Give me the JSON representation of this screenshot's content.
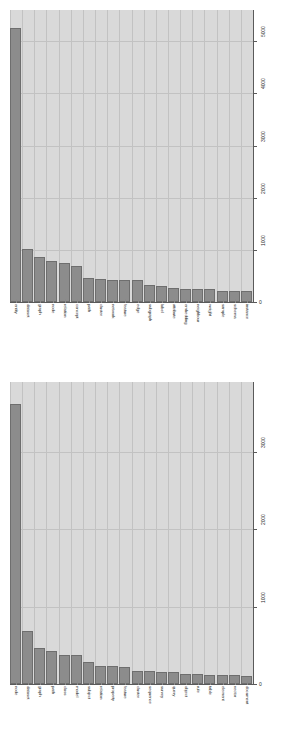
{
  "figure": {
    "background_color": "#ffffff",
    "plot_background_color": "#d9d9d9",
    "gridline_color": "#c2c2c2",
    "bar_color": "#8c8c8c",
    "bar_edge_color": "#6e6e6e",
    "axis_color": "#5a5a5a"
  },
  "chart_data": [
    {
      "type": "bar",
      "title": "",
      "xlabel": "",
      "ylabel": "",
      "grid": true,
      "legend": null,
      "ylim": [
        0,
        5600
      ],
      "yticks": [
        0,
        1000,
        2000,
        3000,
        4000,
        5000
      ],
      "ytick_labels": [
        "0",
        "1000",
        "2000",
        "3000",
        "4000",
        "5000"
      ],
      "ytick_position": "right",
      "xtick_rotation": 90,
      "categories": [
        "entity",
        "dataset",
        "graph",
        "node",
        "relation",
        "concept",
        "path",
        "cluster",
        "network",
        "feature",
        "edge",
        "subgraph",
        "label",
        "attribute",
        "embedding",
        "neighbour",
        "weight",
        "sample",
        "schema",
        "instance"
      ],
      "values": [
        5250,
        1010,
        870,
        790,
        740,
        700,
        470,
        440,
        430,
        430,
        430,
        330,
        310,
        260,
        250,
        250,
        250,
        220,
        220,
        210
      ]
    },
    {
      "type": "bar",
      "title": "",
      "xlabel": "",
      "ylabel": "",
      "grid": true,
      "legend": null,
      "ylim": [
        0,
        3900
      ],
      "yticks": [
        0,
        1000,
        2000,
        3000
      ],
      "ytick_labels": [
        "0",
        "1000",
        "2000",
        "3000"
      ],
      "ytick_position": "right",
      "xtick_rotation": 90,
      "categories": [
        "node",
        "dataset",
        "graph",
        "path",
        "class",
        "model",
        "subject",
        "relation",
        "property",
        "feature",
        "cluster",
        "sequence",
        "survey",
        "query",
        "object",
        "rule",
        "table",
        "element",
        "vector",
        "document"
      ],
      "values": [
        3610,
        690,
        470,
        420,
        370,
        370,
        290,
        235,
        235,
        215,
        170,
        170,
        150,
        150,
        130,
        125,
        120,
        115,
        110,
        105
      ]
    }
  ]
}
